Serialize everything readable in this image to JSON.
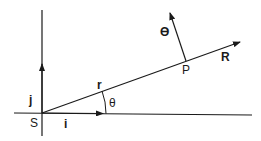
{
  "diagram": {
    "origin_label": "S",
    "unit_vector_x_label": "i",
    "unit_vector_y_label": "j",
    "position_vector_label": "r",
    "angle_label": "θ",
    "point_label": "P",
    "radial_unit_label": "R",
    "transverse_unit_label": "ϴ",
    "line_color": "#1a1a1a"
  }
}
